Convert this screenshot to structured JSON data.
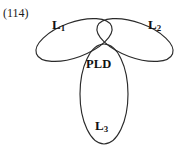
{
  "figure": {
    "number_label": "(114)",
    "background_color": "#ffffff",
    "stroke_color": "#2a2a2a",
    "text_color": "#111111"
  },
  "diagram": {
    "type": "trefoil-venn",
    "nodes": [
      {
        "id": "l1",
        "base": "L",
        "subscript": "1",
        "position": "upper-left",
        "icon_name": "ellipse-upper-left"
      },
      {
        "id": "l2",
        "base": "L",
        "subscript": "2",
        "position": "upper-right",
        "icon_name": "ellipse-upper-right"
      },
      {
        "id": "l3",
        "base": "L",
        "subscript": "3",
        "position": "bottom",
        "icon_name": "ellipse-bottom"
      }
    ],
    "center": {
      "id": "pld",
      "label": "PLD",
      "position": "center-intersection"
    }
  }
}
